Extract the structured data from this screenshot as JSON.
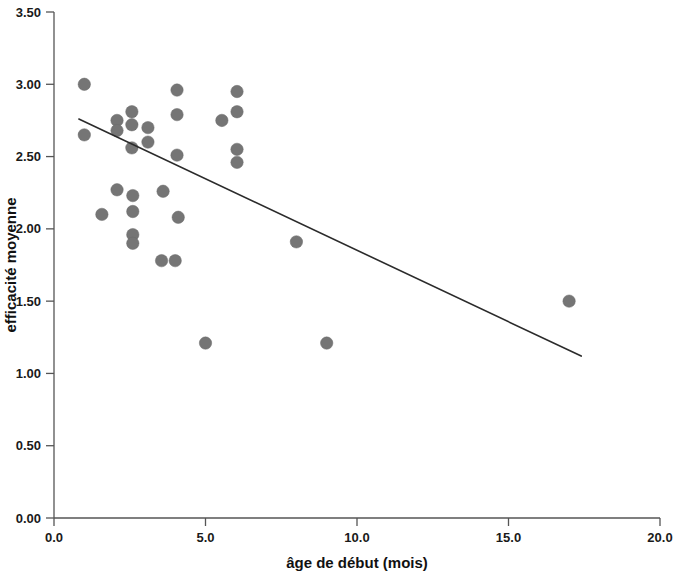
{
  "chart_data": {
    "type": "scatter",
    "title": "",
    "xlabel": "âge de début (mois)",
    "ylabel": "efficacité moyenne",
    "xlim": [
      0.0,
      20.0
    ],
    "ylim": [
      0.0,
      3.5
    ],
    "xticks": [
      0.0,
      5.0,
      10.0,
      15.0,
      20.0
    ],
    "xticklabels": [
      "0.0",
      "5.0",
      "10.0",
      "15.0",
      "20.0"
    ],
    "yticks": [
      0.0,
      0.5,
      1.0,
      1.5,
      2.0,
      2.5,
      3.0,
      3.5
    ],
    "yticklabels": [
      "0.00",
      "0.50",
      "1.00",
      "1.50",
      "2.00",
      "2.50",
      "3.00",
      "3.50"
    ],
    "grid": false,
    "legend": null,
    "marker_color": "#757575",
    "marker_shape": "circle",
    "line_color": "#2b2b2b",
    "points": [
      {
        "x": 1.0,
        "y": 3.0
      },
      {
        "x": 1.0,
        "y": 2.65
      },
      {
        "x": 2.08,
        "y": 2.75
      },
      {
        "x": 2.08,
        "y": 2.68
      },
      {
        "x": 2.57,
        "y": 2.81
      },
      {
        "x": 2.57,
        "y": 2.72
      },
      {
        "x": 2.57,
        "y": 2.56
      },
      {
        "x": 3.1,
        "y": 2.7
      },
      {
        "x": 3.1,
        "y": 2.6
      },
      {
        "x": 4.06,
        "y": 2.96
      },
      {
        "x": 4.06,
        "y": 2.79
      },
      {
        "x": 4.06,
        "y": 2.51
      },
      {
        "x": 5.54,
        "y": 2.75
      },
      {
        "x": 6.04,
        "y": 2.95
      },
      {
        "x": 6.04,
        "y": 2.81
      },
      {
        "x": 6.04,
        "y": 2.55
      },
      {
        "x": 6.04,
        "y": 2.46
      },
      {
        "x": 2.08,
        "y": 2.27
      },
      {
        "x": 2.6,
        "y": 2.23
      },
      {
        "x": 2.6,
        "y": 2.12
      },
      {
        "x": 3.6,
        "y": 2.26
      },
      {
        "x": 1.58,
        "y": 2.1
      },
      {
        "x": 4.1,
        "y": 2.08
      },
      {
        "x": 2.6,
        "y": 1.96
      },
      {
        "x": 2.6,
        "y": 1.9
      },
      {
        "x": 3.55,
        "y": 1.78
      },
      {
        "x": 4.0,
        "y": 1.78
      },
      {
        "x": 8.0,
        "y": 1.91
      },
      {
        "x": 17.0,
        "y": 1.5
      },
      {
        "x": 5.0,
        "y": 1.21
      },
      {
        "x": 9.0,
        "y": 1.21
      }
    ],
    "fit_line": {
      "type": "linear-regression",
      "x_start": 0.82,
      "y_start": 2.76,
      "x_end": 17.4,
      "y_end": 1.12
    }
  }
}
